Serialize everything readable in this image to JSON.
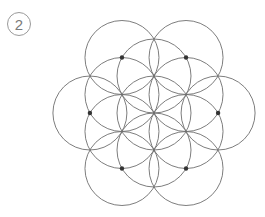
{
  "step": {
    "number": "2"
  },
  "diagram": {
    "center": [
      154,
      113
    ],
    "radius": 37,
    "stroke_color": "#6e6e6e",
    "dot_color": "#333333",
    "inner_ring_angles_deg": [
      30,
      90,
      150,
      210,
      270,
      330
    ],
    "outer_ring_angles_deg": [
      0,
      60,
      120,
      180,
      240,
      300
    ],
    "marked_dots": "centers of outer ring circles"
  }
}
